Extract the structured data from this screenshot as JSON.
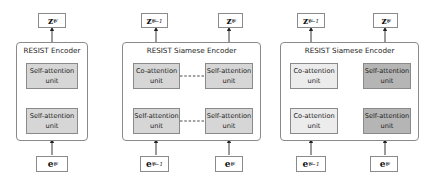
{
  "colors": {
    "self_attention_fill": "#d6d6d6",
    "co_attention_fill": "#ececec",
    "self_attention_dark_fill": "#b5b5b5",
    "border": "#8a8a8a"
  },
  "panels": [
    {
      "title": "RESIST Encoder",
      "outputs": [
        {
          "base": "z",
          "sub": "t",
          "sup": "w"
        }
      ],
      "inputs": [
        {
          "base": "e",
          "sub": "t",
          "sup": "w"
        }
      ],
      "units": [
        {
          "line1": "Self-attention",
          "line2": "unit",
          "type": "self"
        },
        {
          "line1": "Self-attention",
          "line2": "unit",
          "type": "self"
        }
      ]
    },
    {
      "title": "RESIST Siamese Encoder",
      "outputs": [
        {
          "base": "z",
          "sub": "t−1",
          "sup": "w"
        },
        {
          "base": "z",
          "sub": "t",
          "sup": "w"
        }
      ],
      "inputs": [
        {
          "base": "e",
          "sub": "t−1",
          "sup": "w"
        },
        {
          "base": "e",
          "sub": "t",
          "sup": "w"
        }
      ],
      "units": [
        {
          "line1": "Co-attention",
          "line2": "unit",
          "type": "self"
        },
        {
          "line1": "Self-attention",
          "line2": "unit",
          "type": "self"
        },
        {
          "line1": "Self-attention",
          "line2": "unit",
          "type": "self"
        },
        {
          "line1": "Self-attention",
          "line2": "unit",
          "type": "self"
        }
      ]
    },
    {
      "title": "RESIST Siamese Encoder",
      "outputs": [
        {
          "base": "z",
          "sub": "t−1",
          "sup": "w"
        },
        {
          "base": "z",
          "sub": "t",
          "sup": "w"
        }
      ],
      "inputs": [
        {
          "base": "e",
          "sub": "t−1",
          "sup": "w"
        },
        {
          "base": "e",
          "sub": "t",
          "sup": "w"
        }
      ],
      "units": [
        {
          "line1": "Co-attention",
          "line2": "unit",
          "type": "co"
        },
        {
          "line1": "Self-attention",
          "line2": "unit",
          "type": "dark"
        },
        {
          "line1": "Co-attention",
          "line2": "unit",
          "type": "co"
        },
        {
          "line1": "Self-attention",
          "line2": "unit",
          "type": "dark"
        }
      ]
    }
  ]
}
